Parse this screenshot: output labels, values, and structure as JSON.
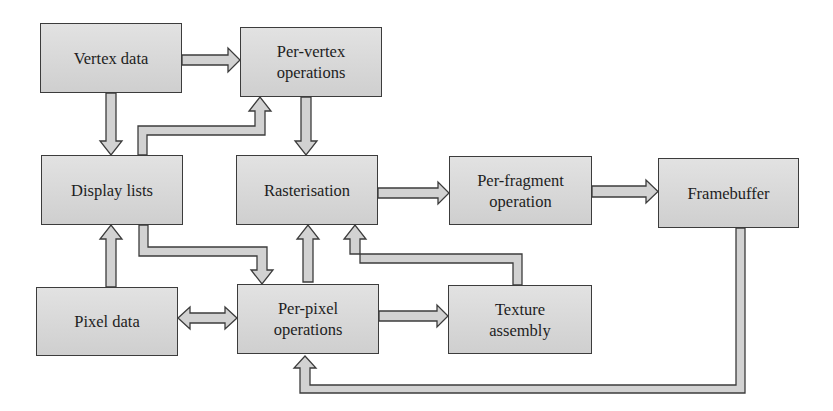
{
  "diagram": {
    "type": "flowchart",
    "title": "",
    "colors": {
      "box_fill_top": "#e2e2e2",
      "box_fill_bottom": "#cfcfcf",
      "box_border": "#3c3c3c",
      "arrow_fill": "#d2d2d2",
      "arrow_stroke": "#3c3c3c",
      "text": "#1e1e1e"
    },
    "nodes": {
      "vertex_data": {
        "label": "Vertex data"
      },
      "per_vertex": {
        "label": "Per-vertex\noperations"
      },
      "display_lists": {
        "label": "Display lists"
      },
      "rasterisation": {
        "label": "Rasterisation"
      },
      "per_fragment": {
        "label": "Per-fragment\noperation"
      },
      "framebuffer": {
        "label": "Framebuffer"
      },
      "pixel_data": {
        "label": "Pixel data"
      },
      "per_pixel": {
        "label": "Per-pixel\noperations"
      },
      "texture_assembly": {
        "label": "Texture\nassembly"
      }
    },
    "edges": [
      {
        "from": "Vertex data",
        "to": "Per-vertex operations"
      },
      {
        "from": "Vertex data",
        "to": "Display lists"
      },
      {
        "from": "Display lists",
        "to": "Per-vertex operations"
      },
      {
        "from": "Per-vertex operations",
        "to": "Rasterisation"
      },
      {
        "from": "Rasterisation",
        "to": "Per-fragment operation"
      },
      {
        "from": "Per-fragment operation",
        "to": "Framebuffer"
      },
      {
        "from": "Pixel data",
        "to": "Display lists"
      },
      {
        "from": "Display lists",
        "to": "Per-pixel operations"
      },
      {
        "from": "Pixel data",
        "to": "Per-pixel operations",
        "bidirectional": true
      },
      {
        "from": "Per-pixel operations",
        "to": "Rasterisation"
      },
      {
        "from": "Per-pixel operations",
        "to": "Texture assembly"
      },
      {
        "from": "Texture assembly",
        "to": "Rasterisation"
      },
      {
        "from": "Framebuffer",
        "to": "Per-pixel operations"
      }
    ]
  }
}
